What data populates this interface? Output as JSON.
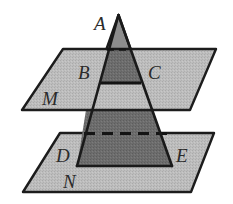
{
  "figure": {
    "background_color": "#ffffff",
    "plane_fill_color": "#b9b9b9",
    "plane_stroke_color": "#1c1c1c",
    "solid_fill_color": "#6e6e6e",
    "solid_stroke_color": "#1a1a1a",
    "upper_band_fill_color": "#5f5f5f",
    "label_color": "#2b2b2b",
    "dashed_stroke_color": "#141414"
  },
  "labels": [
    {
      "id": "A",
      "text": "A",
      "x": 94,
      "y": 14,
      "size": 19,
      "desc": "apex-of-pyramid"
    },
    {
      "id": "B",
      "text": "B",
      "x": 78,
      "y": 63,
      "size": 19,
      "desc": "left-intersection-with-plane-M"
    },
    {
      "id": "C",
      "text": "C",
      "x": 148,
      "y": 63,
      "size": 19,
      "desc": "right-intersection-with-plane-M"
    },
    {
      "id": "M",
      "text": "M",
      "x": 42,
      "y": 89,
      "size": 19,
      "desc": "upper-plane-name"
    },
    {
      "id": "D",
      "text": "D",
      "x": 56,
      "y": 146,
      "size": 19,
      "desc": "left-base-vertex-on-plane-N"
    },
    {
      "id": "E",
      "text": "E",
      "x": 176,
      "y": 146,
      "size": 19,
      "desc": "right-base-vertex-on-plane-N"
    },
    {
      "id": "N",
      "text": "N",
      "x": 63,
      "y": 172,
      "size": 19,
      "desc": "lower-plane-name"
    }
  ],
  "geometry": {
    "apex": {
      "x": 118.5,
      "y": 15
    },
    "triangle_base": {
      "left_x": 77,
      "right_x": 172,
      "y": 166
    },
    "plane_M": {
      "points": "63,49 216,49 190,110 22,110",
      "front_edge_y": 110,
      "back_edge_y": 49
    },
    "plane_N": {
      "points": "60,133 214,133 191,192 23,192",
      "front_edge_y": 192,
      "back_edge_y": 133
    },
    "cut_BC": {
      "left_x": 100,
      "right_x": 140,
      "y": 83
    },
    "back_cut_M": {
      "left_x": 110,
      "right_x": 128,
      "y": 49
    },
    "back_cut_N": {
      "left_x": 84,
      "right_x": 166,
      "y": 133
    },
    "front_exit_M": {
      "left_x": 86,
      "right_x": 153,
      "y": 110
    }
  },
  "elements": {
    "plane_m_name": "upper-plane",
    "plane_n_name": "lower-plane",
    "pyramid_name": "triangular-solid"
  }
}
